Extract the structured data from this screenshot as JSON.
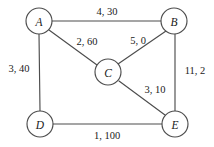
{
  "diagram": {
    "type": "undirected-weighted-graph",
    "canvas": {
      "width": 214,
      "height": 147,
      "background": "#ffffff"
    },
    "style": {
      "stroke_color": "#4d4d4d",
      "text_color": "#1a1a1a",
      "node_fill": "#ffffff",
      "node_radius": 13
    },
    "nodes": [
      {
        "id": "A",
        "label": "A",
        "cx": 39,
        "cy": 21,
        "r": 13
      },
      {
        "id": "B",
        "label": "B",
        "cx": 174,
        "cy": 21,
        "r": 13
      },
      {
        "id": "C",
        "label": "C",
        "cx": 108,
        "cy": 72,
        "r": 13
      },
      {
        "id": "D",
        "label": "D",
        "cx": 40,
        "cy": 124,
        "r": 13
      },
      {
        "id": "E",
        "label": "E",
        "cx": 175,
        "cy": 124,
        "r": 13
      }
    ],
    "edges": [
      {
        "id": "A-B",
        "from": "A",
        "to": "B",
        "label": "4, 30",
        "weight1": 4,
        "weight2": 30,
        "x1": 52,
        "y1": 21,
        "x2": 161,
        "y2": 21,
        "label_x": 107,
        "label_y": 11
      },
      {
        "id": "A-C",
        "from": "A",
        "to": "C",
        "label": "2, 60",
        "weight1": 2,
        "weight2": 60,
        "x1": 49,
        "y1": 30,
        "x2": 97,
        "y2": 65,
        "label_x": 87,
        "label_y": 41
      },
      {
        "id": "C-B",
        "from": "C",
        "to": "B",
        "label": "5, 0",
        "weight1": 5,
        "weight2": 0,
        "x1": 118,
        "y1": 64,
        "x2": 166,
        "y2": 31,
        "label_x": 138,
        "label_y": 40
      },
      {
        "id": "A-D",
        "from": "A",
        "to": "D",
        "label": "3, 40",
        "weight1": 3,
        "weight2": 40,
        "x1": 39,
        "y1": 34,
        "x2": 40,
        "y2": 111,
        "label_x": 19,
        "label_y": 68
      },
      {
        "id": "B-E",
        "from": "B",
        "to": "E",
        "label": "11, 2",
        "weight1": 11,
        "weight2": 2,
        "x1": 175,
        "y1": 34,
        "x2": 175,
        "y2": 111,
        "label_x": 195,
        "label_y": 70
      },
      {
        "id": "C-E",
        "from": "C",
        "to": "E",
        "label": "3, 10",
        "weight1": 3,
        "weight2": 10,
        "x1": 119,
        "y1": 81,
        "x2": 165,
        "y2": 115,
        "label_x": 155,
        "label_y": 89
      },
      {
        "id": "D-E",
        "from": "D",
        "to": "E",
        "label": "1, 100",
        "weight1": 1,
        "weight2": 100,
        "x1": 53,
        "y1": 124,
        "x2": 162,
        "y2": 124,
        "label_x": 107,
        "label_y": 135
      }
    ]
  }
}
